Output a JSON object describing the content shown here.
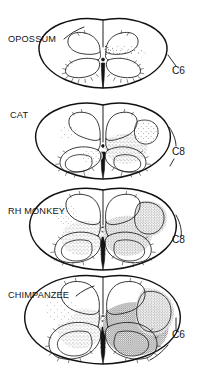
{
  "figure": {
    "kind": "comparative-anatomy-line-drawing",
    "background_color": "#ffffff",
    "ink_color": "#141414",
    "width": 206,
    "height": 388
  },
  "panels": [
    {
      "id": "opossum",
      "species_label": "OPOSSUM",
      "level_label": "C6",
      "species_label_x": 8,
      "species_label_y": 42,
      "level_label_x": 172,
      "level_label_y": 74,
      "center_x": 103,
      "center_y": 55,
      "half_width": 64,
      "half_height": 35,
      "stipple_density": "sparse",
      "stipple_sides": [
        "right"
      ],
      "stipple_extent": "dorsal horn base and intermediate zone only"
    },
    {
      "id": "cat",
      "species_label": "CAT",
      "level_label": "C8",
      "species_label_x": 10,
      "species_label_y": 118,
      "level_label_x": 172,
      "level_label_y": 155,
      "center_x": 103,
      "center_y": 143,
      "half_width": 68,
      "half_height": 38,
      "stipple_density": "moderate",
      "stipple_sides": [
        "right",
        "left-faint"
      ],
      "stipple_extent": "intermediate zone plus lateral funiculus patch"
    },
    {
      "id": "rh-monkey",
      "species_label": "RH MONKEY",
      "level_label": "C8",
      "species_label_x": 8,
      "species_label_y": 214,
      "level_label_x": 172,
      "level_label_y": 243,
      "center_x": 103,
      "center_y": 228,
      "half_width": 73,
      "half_height": 41,
      "stipple_density": "dense",
      "stipple_sides": [
        "right",
        "left"
      ],
      "stipple_extent": "intermediate zone, ventral horn margin and dorsolateral funiculus"
    },
    {
      "id": "chimpanzee",
      "species_label": "CHIMPANZEE",
      "level_label": "C6",
      "species_label_x": 8,
      "species_label_y": 298,
      "level_label_x": 172,
      "level_label_y": 338,
      "center_x": 103,
      "center_y": 320,
      "half_width": 76,
      "half_height": 44,
      "stipple_density": "very dense",
      "stipple_sides": [
        "right",
        "left"
      ],
      "stipple_extent": "entire ventral horn and lateral funiculus, heaviest of the series"
    }
  ],
  "legend_note": {
    "reading_order": "top to bottom",
    "trend": "corticospinal projection territory expands from opossum through chimpanzee"
  }
}
